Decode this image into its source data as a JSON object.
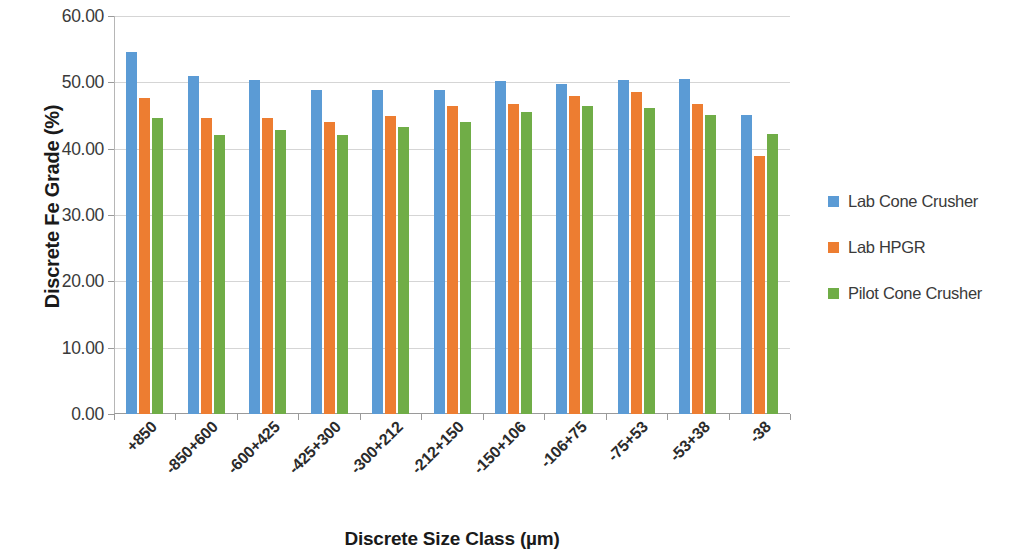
{
  "chart_data": {
    "type": "bar",
    "title": "",
    "xlabel": "Discrete Size Class (µm)",
    "ylabel": "Discrete Fe Grade (%)",
    "categories": [
      "+850",
      "-850+600",
      "-600+425",
      "-425+300",
      "-300+212",
      "-212+150",
      "-150+106",
      "-106+75",
      "-75+53",
      "-53+38",
      "-38"
    ],
    "series": [
      {
        "name": "Lab Cone Crusher",
        "color": "#5B9BD5",
        "values": [
          54.5,
          51.0,
          50.3,
          48.8,
          48.8,
          48.9,
          50.2,
          49.7,
          50.4,
          50.5,
          45.1
        ]
      },
      {
        "name": "Lab HPGR",
        "color": "#ED7D31",
        "values": [
          47.7,
          44.6,
          44.6,
          44.0,
          44.9,
          46.4,
          46.8,
          48.0,
          48.6,
          46.7,
          38.9
        ]
      },
      {
        "name": "Pilot Cone Crusher",
        "color": "#70AD47",
        "values": [
          44.7,
          42.1,
          42.8,
          42.0,
          43.2,
          44.0,
          45.5,
          46.5,
          46.2,
          45.1,
          42.2
        ]
      }
    ],
    "ylim": [
      0,
      60
    ],
    "ytick_step": 10,
    "ytick_labels": [
      "0.00",
      "10.00",
      "20.00",
      "30.00",
      "40.00",
      "50.00",
      "60.00"
    ],
    "ytick_values": [
      0,
      10,
      20,
      30,
      40,
      50,
      60
    ],
    "grid": true,
    "legend_position": "right"
  }
}
